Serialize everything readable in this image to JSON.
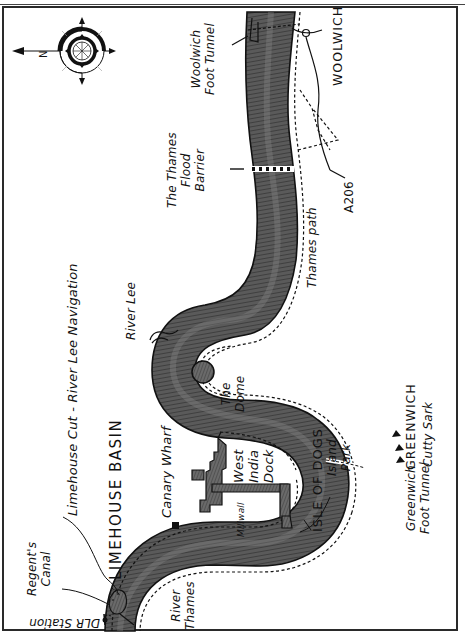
{
  "map": {
    "title": "Thames map: Limehouse Basin to Woolwich",
    "orientation": "rotated 90° (north points left)",
    "compass": {
      "label": "N",
      "icon": "compass-rose-icon"
    },
    "colors": {
      "river": "#4a4a4a",
      "river_light": "#7a7a7a",
      "ink": "#111111",
      "paper": "#ffffff",
      "border": "#2a2a2a"
    },
    "labels": {
      "woolwich_foot_tunnel": [
        "Woolwich",
        "Foot Tunnel"
      ],
      "woolwich": "WOOLWICH",
      "thames_flood_barrier": [
        "The Thames",
        "Flood",
        "Barrier"
      ],
      "a206": "A206",
      "thames_path": "Thames path",
      "river_lee": "River Lee",
      "limehouse_cut": "Limehouse Cut - River Lee Navigation",
      "limehouse_basin": "LIMEHOUSE BASIN",
      "the_dome": [
        "The",
        "Dome"
      ],
      "canary_wharf": "Canary Wharf",
      "west_india_dock": [
        "West",
        "India",
        "Dock"
      ],
      "isle_of_dogs": "ISLE OF DOGS",
      "island_park": [
        "Island",
        "Park"
      ],
      "millwall": "Millwall",
      "greenwich": "GREENWICH",
      "cutty_sark": "Cutty Sark",
      "greenwich_foot_tunnel": [
        "Greenwich",
        "Foot Tunnel"
      ],
      "regents_canal": [
        "Regent's",
        "Canal"
      ],
      "river_thames": [
        "River",
        "Thames"
      ],
      "dlr_station": "DLR Station"
    }
  }
}
